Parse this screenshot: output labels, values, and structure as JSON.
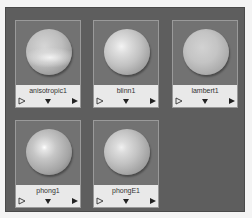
{
  "panel": {
    "background": "#5e5e5e"
  },
  "materials": [
    {
      "name": "anisotropic1",
      "type": "anisotropic"
    },
    {
      "name": "blinn1",
      "type": "blinn"
    },
    {
      "name": "lambert1",
      "type": "lambert"
    },
    {
      "name": "phong1",
      "type": "phong"
    },
    {
      "name": "phongE1",
      "type": "phongE"
    }
  ],
  "controls": {
    "input_icon": "hollow-right-triangle",
    "menu_icon": "down-triangle",
    "output_icon": "filled-right-triangle"
  }
}
